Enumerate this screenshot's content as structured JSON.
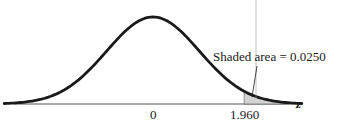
{
  "chart_data": {
    "type": "area",
    "title": "",
    "xlabel": "z",
    "ylabel": "",
    "x_ticks": [
      {
        "value": 0,
        "label": "0"
      },
      {
        "value": 1.96,
        "label": "1.960"
      }
    ],
    "curve": "standard normal density",
    "mean": 0,
    "sd": 1,
    "xlim": [
      -3.2,
      3.2
    ],
    "shaded_region": {
      "from": 1.96,
      "to": 3.2,
      "area": 0.025
    },
    "annotation": "Shaded area = 0.0250",
    "grid": false,
    "legend": "none"
  },
  "labels": {
    "annotation": "Shaded area = 0.0250",
    "tick_zero": "0",
    "tick_critical": "1.960",
    "axis_label": "z"
  },
  "colors": {
    "curve": "#1a1a1a",
    "axis": "#333333",
    "shade": "#d3d3d3"
  }
}
